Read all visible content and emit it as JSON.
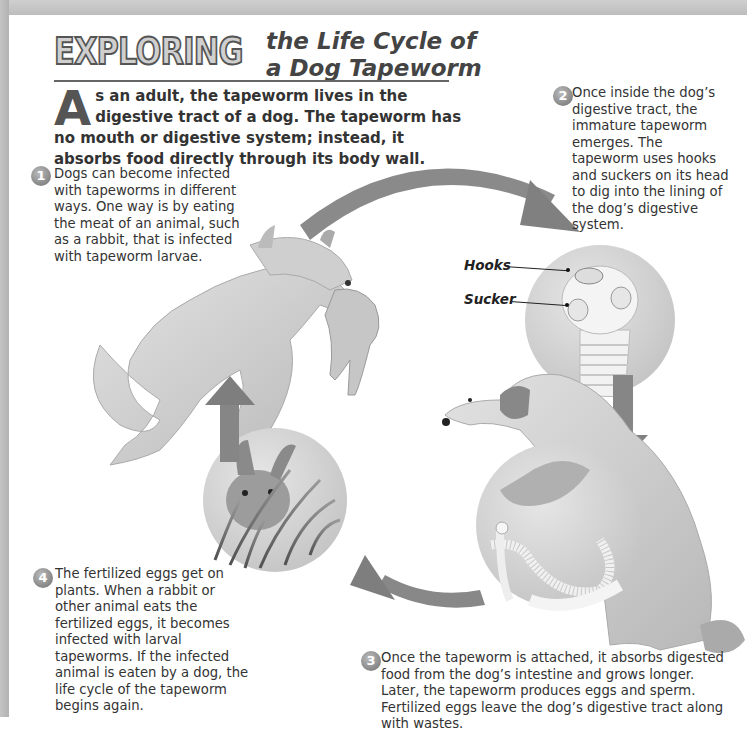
{
  "title": {
    "display_word": "EXPLORING",
    "line1": "the Life Cycle of",
    "line2": "a Dog Tapeworm"
  },
  "intro": {
    "drop_cap": "A",
    "text": "s an adult, the tapeworm lives in the digestive tract of a dog. The tapeworm has no mouth or digestive system; instead, it absorbs food directly through its body wall."
  },
  "steps": [
    {
      "number": "1",
      "text": "Dogs can become infected with tapeworms in different ways. One way is by eating the meat of an animal, such as a rabbit, that is infected with tapeworm larvae."
    },
    {
      "number": "2",
      "text": "Once inside the dog’s digestive tract, the immature tapeworm emerges. The tapeworm uses hooks and suckers on its head to dig into the lining of the dog’s digestive system."
    },
    {
      "number": "3",
      "text": "Once the tapeworm is attached, it absorbs digested food from the dog’s intestine and grows longer. Later, the tapeworm produces eggs and sperm. Fertilized eggs leave the dog’s digestive tract along with wastes."
    },
    {
      "number": "4",
      "text": "The fertilized eggs get on plants. When a rabbit or other animal eats the fertilized eggs, it becomes infected with larval tapeworms. If the infected animal is eaten by a dog, the life cycle of the tapeworm begins again."
    }
  ],
  "labels": {
    "hooks": "Hooks",
    "sucker": "Sucker"
  },
  "illustrations": {
    "dog_with_rabbit": "leaping-dog-carrying-rabbit",
    "tapeworm_head": "tapeworm-scolex-closeup",
    "sitting_dog": "sitting-dog",
    "intestine": "tapeworm-in-intestine-closeup",
    "rabbit": "rabbit-eating-grass"
  },
  "colors": {
    "arrow": "#7a7a7a",
    "circle_bg": "#d6d6d6",
    "text": "#333333"
  }
}
